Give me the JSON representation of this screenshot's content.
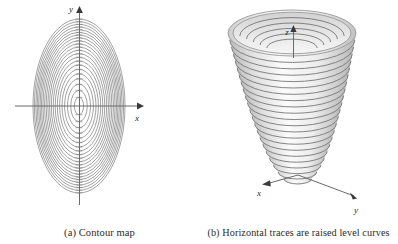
{
  "figure": {
    "background_color": "#ffffff",
    "width": 398,
    "height": 244
  },
  "panel_a": {
    "caption": "(a) Contour map",
    "axis_labels": {
      "x": "x",
      "y": "y"
    },
    "colors": {
      "contour_line": "#7a7a7a",
      "axis_line": "#6b6b6b",
      "label": "#2b2b2b"
    },
    "chart_data": {
      "type": "line",
      "title": "(a) Contour map",
      "xlabel": "x",
      "ylabel": "y",
      "grid": false,
      "legend": "none",
      "description": "Nested concentric ellipses centered at the origin, elongated along the y-axis; level curves of an elliptic paraboloid.",
      "center": [
        79,
        106
      ],
      "n_contours": 20,
      "semi_axis_a_outer": 46,
      "semi_axis_b_outer": 87,
      "semi_axis_ratio_b_over_a": 1.89,
      "axis_extent_x": [
        15,
        142
      ],
      "axis_extent_y": [
        8,
        205
      ],
      "contour_semi_axes_a": [
        4.6,
        8.3,
        11.5,
        14.4,
        17.0,
        19.4,
        21.7,
        23.8,
        25.8,
        27.7,
        29.5,
        31.2,
        32.9,
        34.5,
        36.1,
        37.6,
        39.0,
        40.4,
        41.8,
        43.2,
        44.6,
        46.0
      ],
      "tick_marks_on_axes": true
    }
  },
  "panel_b": {
    "caption": "(b) Horizontal traces are raised level curves",
    "axis_labels": {
      "x": "x",
      "y": "y",
      "z": "z"
    },
    "colors": {
      "surface_light": "#f4f4f4",
      "surface_mid": "#dcdcdc",
      "surface_shadow": "#bdbdbd",
      "trace_line": "#6f6f6f",
      "axis_line": "#545454",
      "label": "#2b2b2b"
    },
    "chart_data": {
      "type": "line",
      "title": "(b) Horizontal traces are raised level curves",
      "xlabel": "x",
      "ylabel": "y",
      "zlabel": "z",
      "grid": false,
      "legend": "none",
      "description": "Elliptic paraboloid shown in 3D with horizontal traces drawn as stacked elliptical level curves rising from the vertex at the origin.",
      "origin_px": [
        298,
        185
      ],
      "vertex_px": [
        298,
        185
      ],
      "top_rim_center_px": [
        292,
        33
      ],
      "top_rim_semi_x": 64,
      "top_rim_semi_y": 23,
      "n_traces": 22,
      "axis_x_end_px": [
        262,
        193
      ],
      "axis_y_end_px": [
        356,
        204
      ],
      "axis_z_end_px": [
        293,
        27
      ]
    }
  }
}
